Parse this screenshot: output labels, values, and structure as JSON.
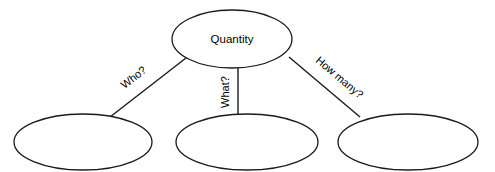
{
  "diagram": {
    "type": "concept-map",
    "background_color": "#ffffff",
    "stroke_color": "#1a1a1a",
    "text_color": "#000000",
    "root_node": {
      "id": "quantity",
      "label": "Quantity",
      "shape": "ellipse",
      "cx": 232,
      "cy": 39,
      "rx": 60,
      "ry": 29
    },
    "child_nodes": [
      {
        "id": "child-who",
        "label": "",
        "shape": "ellipse",
        "cx": 83,
        "cy": 142,
        "rx": 69,
        "ry": 28
      },
      {
        "id": "child-what",
        "label": "",
        "shape": "ellipse",
        "cx": 247,
        "cy": 142,
        "rx": 71,
        "ry": 28
      },
      {
        "id": "child-how-many",
        "label": "",
        "shape": "ellipse",
        "cx": 408,
        "cy": 142,
        "rx": 70,
        "ry": 28
      }
    ],
    "edges": [
      {
        "id": "edge-who",
        "label": "Who?",
        "from": "quantity",
        "to": "child-who",
        "x1": 186,
        "y1": 58,
        "x2": 110,
        "y2": 117,
        "label_x": 134,
        "label_y": 78,
        "label_rotation": -38
      },
      {
        "id": "edge-what",
        "label": "What?",
        "from": "quantity",
        "to": "child-what",
        "x1": 238,
        "y1": 68,
        "x2": 238,
        "y2": 116,
        "label_x": 226,
        "label_y": 92,
        "label_rotation": -90
      },
      {
        "id": "edge-how-many",
        "label": "How many?",
        "from": "quantity",
        "to": "child-how-many",
        "x1": 289,
        "y1": 57,
        "x2": 360,
        "y2": 117,
        "label_x": 339,
        "label_y": 78,
        "label_rotation": 40
      }
    ]
  }
}
